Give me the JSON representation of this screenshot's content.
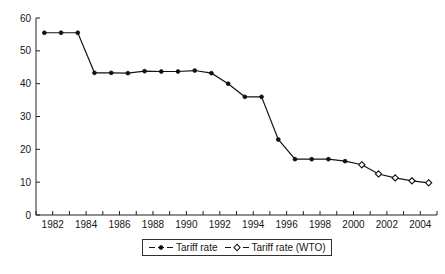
{
  "chart_data": {
    "type": "line",
    "title": "",
    "xlabel": "",
    "ylabel": "",
    "xlim": [
      1981,
      2005
    ],
    "ylim": [
      0,
      60
    ],
    "grid": false,
    "legend_position": "below-axis-center",
    "y_ticks": [
      "0",
      "10",
      "20",
      "30",
      "40",
      "50",
      "60"
    ],
    "y_tick_values": [
      0,
      10,
      20,
      30,
      40,
      50,
      60
    ],
    "x_ticks": [
      "1982",
      "1984",
      "1986",
      "1988",
      "1990",
      "1992",
      "1994",
      "1996",
      "1998",
      "2000",
      "2002",
      "2004"
    ],
    "x_tick_values": [
      1982,
      1984,
      1986,
      1988,
      1990,
      1992,
      1994,
      1996,
      1998,
      2000,
      2002,
      2004
    ],
    "x_minor_tick_values": [
      1981,
      1983,
      1985,
      1987,
      1989,
      1991,
      1993,
      1995,
      1997,
      1999,
      2001,
      2003,
      2005
    ],
    "series": [
      {
        "name": "Tariff rate",
        "marker": "filled-circle",
        "x": [
          1981.5,
          1982.5,
          1983.5,
          1984.5,
          1985.5,
          1986.5,
          1987.5,
          1988.5,
          1989.5,
          1990.5,
          1991.5,
          1992.5,
          1993.5,
          1994.5,
          1995.5,
          1996.5,
          1997.5,
          1998.5,
          1999.5
        ],
        "values": [
          55.5,
          55.5,
          55.5,
          43.3,
          43.3,
          43.2,
          43.8,
          43.7,
          43.7,
          44.0,
          43.2,
          40.0,
          36.0,
          36.0,
          23.0,
          17.0,
          17.0,
          17.0,
          16.4
        ]
      },
      {
        "name": "Tariff rate (WTO)",
        "marker": "open-diamond",
        "x": [
          2000.5,
          2001.5,
          2002.5,
          2003.5,
          2004.5
        ],
        "values": [
          15.3,
          12.5,
          11.3,
          10.4,
          9.8
        ]
      }
    ]
  },
  "legend": {
    "entries": [
      {
        "label": "Tariff rate",
        "marker": "filled-circle"
      },
      {
        "label": "Tariff rate (WTO)",
        "marker": "open-diamond"
      }
    ]
  },
  "caption": {
    "text": ""
  },
  "colors": {
    "line": "#151515",
    "marker_fill": "#101010",
    "marker_open_fill": "#ffffff",
    "axis": "#202020",
    "background": "#ffffff"
  }
}
